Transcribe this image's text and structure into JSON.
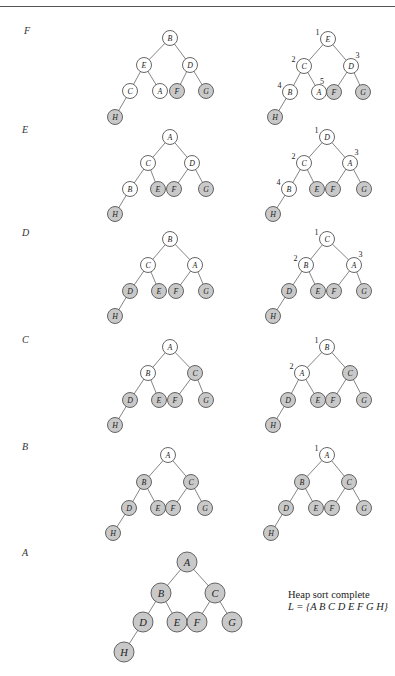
{
  "colors": {
    "sorted_fill": "#c9c9c9",
    "unsorted_fill": "#ffffff",
    "stroke": "#555555",
    "edge": "#666666",
    "text": "#222222",
    "rule": "#555555"
  },
  "edges": [
    [
      "0",
      "1"
    ],
    [
      "0",
      "2"
    ],
    [
      "1",
      "3"
    ],
    [
      "1",
      "4"
    ],
    [
      "2",
      "5"
    ],
    [
      "2",
      "6"
    ],
    [
      "3",
      "7"
    ]
  ],
  "steps": [
    {
      "label": "F",
      "label_pos": [
        24,
        32
      ],
      "before": {
        "r": 7.5,
        "nodes": [
          {
            "id": "0",
            "letter": "B",
            "x": 170,
            "y": 38,
            "sorted": false
          },
          {
            "id": "1",
            "letter": "E",
            "x": 144,
            "y": 65,
            "sorted": false
          },
          {
            "id": "2",
            "letter": "D",
            "x": 190,
            "y": 65,
            "sorted": false
          },
          {
            "id": "3",
            "letter": "C",
            "x": 130,
            "y": 91,
            "sorted": false
          },
          {
            "id": "4",
            "letter": "A",
            "x": 160,
            "y": 91,
            "sorted": false
          },
          {
            "id": "5",
            "letter": "F",
            "x": 177,
            "y": 91,
            "sorted": true
          },
          {
            "id": "6",
            "letter": "G",
            "x": 206,
            "y": 91,
            "sorted": true
          },
          {
            "id": "7",
            "letter": "H",
            "x": 115,
            "y": 117,
            "sorted": true
          }
        ]
      },
      "after": {
        "r": 7.5,
        "nodes": [
          {
            "id": "0",
            "letter": "E",
            "x": 328,
            "y": 39,
            "sorted": false,
            "index": "1"
          },
          {
            "id": "1",
            "letter": "C",
            "x": 304,
            "y": 66,
            "sorted": false,
            "index": "2"
          },
          {
            "id": "2",
            "letter": "D",
            "x": 351,
            "y": 66,
            "sorted": false,
            "index": "3"
          },
          {
            "id": "3",
            "letter": "B",
            "x": 290,
            "y": 92,
            "sorted": false,
            "index": "4"
          },
          {
            "id": "4",
            "letter": "A",
            "x": 319,
            "y": 92,
            "sorted": false,
            "index": "5"
          },
          {
            "id": "5",
            "letter": "F",
            "x": 334,
            "y": 92,
            "sorted": true
          },
          {
            "id": "6",
            "letter": "G",
            "x": 363,
            "y": 92,
            "sorted": true
          },
          {
            "id": "7",
            "letter": "H",
            "x": 275,
            "y": 117,
            "sorted": true
          }
        ]
      }
    },
    {
      "label": "E",
      "label_pos": [
        22,
        131
      ],
      "before": {
        "r": 7.5,
        "nodes": [
          {
            "id": "0",
            "letter": "A",
            "x": 170,
            "y": 137,
            "sorted": false
          },
          {
            "id": "1",
            "letter": "C",
            "x": 148,
            "y": 163,
            "sorted": false
          },
          {
            "id": "2",
            "letter": "D",
            "x": 192,
            "y": 163,
            "sorted": false
          },
          {
            "id": "3",
            "letter": "B",
            "x": 130,
            "y": 189,
            "sorted": false
          },
          {
            "id": "4",
            "letter": "E",
            "x": 158,
            "y": 189,
            "sorted": true
          },
          {
            "id": "5",
            "letter": "F",
            "x": 174,
            "y": 189,
            "sorted": true
          },
          {
            "id": "6",
            "letter": "G",
            "x": 206,
            "y": 189,
            "sorted": true
          },
          {
            "id": "7",
            "letter": "H",
            "x": 115,
            "y": 214,
            "sorted": true
          }
        ]
      },
      "after": {
        "r": 7.5,
        "nodes": [
          {
            "id": "0",
            "letter": "D",
            "x": 327,
            "y": 137,
            "sorted": false,
            "index": "1"
          },
          {
            "id": "1",
            "letter": "C",
            "x": 304,
            "y": 163,
            "sorted": false,
            "index": "2"
          },
          {
            "id": "2",
            "letter": "A",
            "x": 350,
            "y": 163,
            "sorted": false,
            "index": "3"
          },
          {
            "id": "3",
            "letter": "B",
            "x": 289,
            "y": 189,
            "sorted": false,
            "index": "4"
          },
          {
            "id": "4",
            "letter": "E",
            "x": 317,
            "y": 189,
            "sorted": true
          },
          {
            "id": "5",
            "letter": "F",
            "x": 333,
            "y": 189,
            "sorted": true
          },
          {
            "id": "6",
            "letter": "G",
            "x": 364,
            "y": 189,
            "sorted": true
          },
          {
            "id": "7",
            "letter": "H",
            "x": 273,
            "y": 214,
            "sorted": true
          }
        ]
      }
    },
    {
      "label": "D",
      "label_pos": [
        22,
        234
      ],
      "before": {
        "r": 7.5,
        "nodes": [
          {
            "id": "0",
            "letter": "B",
            "x": 170,
            "y": 239,
            "sorted": false
          },
          {
            "id": "1",
            "letter": "C",
            "x": 148,
            "y": 265,
            "sorted": false
          },
          {
            "id": "2",
            "letter": "A",
            "x": 195,
            "y": 265,
            "sorted": false
          },
          {
            "id": "3",
            "letter": "D",
            "x": 130,
            "y": 291,
            "sorted": true
          },
          {
            "id": "4",
            "letter": "E",
            "x": 159,
            "y": 291,
            "sorted": true
          },
          {
            "id": "5",
            "letter": "F",
            "x": 176,
            "y": 291,
            "sorted": true
          },
          {
            "id": "6",
            "letter": "G",
            "x": 206,
            "y": 291,
            "sorted": true
          },
          {
            "id": "7",
            "letter": "H",
            "x": 115,
            "y": 316,
            "sorted": true
          }
        ]
      },
      "after": {
        "r": 7.5,
        "nodes": [
          {
            "id": "0",
            "letter": "C",
            "x": 327,
            "y": 239,
            "sorted": false,
            "index": "1"
          },
          {
            "id": "1",
            "letter": "B",
            "x": 306,
            "y": 265,
            "sorted": false,
            "index": "2"
          },
          {
            "id": "2",
            "letter": "A",
            "x": 354,
            "y": 265,
            "sorted": false,
            "index": "3"
          },
          {
            "id": "3",
            "letter": "D",
            "x": 289,
            "y": 291,
            "sorted": true
          },
          {
            "id": "4",
            "letter": "E",
            "x": 318,
            "y": 291,
            "sorted": true
          },
          {
            "id": "5",
            "letter": "F",
            "x": 334,
            "y": 291,
            "sorted": true
          },
          {
            "id": "6",
            "letter": "G",
            "x": 364,
            "y": 291,
            "sorted": true
          },
          {
            "id": "7",
            "letter": "H",
            "x": 273,
            "y": 316,
            "sorted": true
          }
        ]
      }
    },
    {
      "label": "C",
      "label_pos": [
        22,
        341
      ],
      "before": {
        "r": 7.5,
        "nodes": [
          {
            "id": "0",
            "letter": "A",
            "x": 170,
            "y": 347,
            "sorted": false
          },
          {
            "id": "1",
            "letter": "B",
            "x": 148,
            "y": 373,
            "sorted": false
          },
          {
            "id": "2",
            "letter": "C",
            "x": 195,
            "y": 373,
            "sorted": true
          },
          {
            "id": "3",
            "letter": "D",
            "x": 130,
            "y": 400,
            "sorted": true
          },
          {
            "id": "4",
            "letter": "E",
            "x": 159,
            "y": 400,
            "sorted": true
          },
          {
            "id": "5",
            "letter": "F",
            "x": 175,
            "y": 400,
            "sorted": true
          },
          {
            "id": "6",
            "letter": "G",
            "x": 206,
            "y": 400,
            "sorted": true
          },
          {
            "id": "7",
            "letter": "H",
            "x": 115,
            "y": 425,
            "sorted": true
          }
        ]
      },
      "after": {
        "r": 7.5,
        "nodes": [
          {
            "id": "0",
            "letter": "B",
            "x": 327,
            "y": 347,
            "sorted": false,
            "index": "1"
          },
          {
            "id": "1",
            "letter": "A",
            "x": 302,
            "y": 373,
            "sorted": false,
            "index": "2"
          },
          {
            "id": "2",
            "letter": "C",
            "x": 350,
            "y": 373,
            "sorted": true
          },
          {
            "id": "3",
            "letter": "D",
            "x": 288,
            "y": 400,
            "sorted": true
          },
          {
            "id": "4",
            "letter": "E",
            "x": 318,
            "y": 400,
            "sorted": true
          },
          {
            "id": "5",
            "letter": "F",
            "x": 333,
            "y": 400,
            "sorted": true
          },
          {
            "id": "6",
            "letter": "G",
            "x": 364,
            "y": 400,
            "sorted": true
          },
          {
            "id": "7",
            "letter": "H",
            "x": 273,
            "y": 425,
            "sorted": true
          }
        ]
      }
    },
    {
      "label": "B",
      "label_pos": [
        22,
        448
      ],
      "before": {
        "r": 7.5,
        "nodes": [
          {
            "id": "0",
            "letter": "A",
            "x": 168,
            "y": 455,
            "sorted": false
          },
          {
            "id": "1",
            "letter": "B",
            "x": 144,
            "y": 482,
            "sorted": true
          },
          {
            "id": "2",
            "letter": "C",
            "x": 191,
            "y": 482,
            "sorted": true
          },
          {
            "id": "3",
            "letter": "D",
            "x": 129,
            "y": 508,
            "sorted": true
          },
          {
            "id": "4",
            "letter": "E",
            "x": 158,
            "y": 508,
            "sorted": true
          },
          {
            "id": "5",
            "letter": "F",
            "x": 173,
            "y": 508,
            "sorted": true
          },
          {
            "id": "6",
            "letter": "G",
            "x": 205,
            "y": 508,
            "sorted": true
          },
          {
            "id": "7",
            "letter": "H",
            "x": 113,
            "y": 533,
            "sorted": true
          }
        ]
      },
      "after": {
        "r": 7.5,
        "nodes": [
          {
            "id": "0",
            "letter": "A",
            "x": 327,
            "y": 455,
            "sorted": false,
            "index": "1"
          },
          {
            "id": "1",
            "letter": "B",
            "x": 302,
            "y": 482,
            "sorted": true
          },
          {
            "id": "2",
            "letter": "C",
            "x": 349,
            "y": 482,
            "sorted": true
          },
          {
            "id": "3",
            "letter": "D",
            "x": 286,
            "y": 508,
            "sorted": true
          },
          {
            "id": "4",
            "letter": "E",
            "x": 316,
            "y": 508,
            "sorted": true
          },
          {
            "id": "5",
            "letter": "F",
            "x": 332,
            "y": 508,
            "sorted": true
          },
          {
            "id": "6",
            "letter": "G",
            "x": 364,
            "y": 508,
            "sorted": true
          },
          {
            "id": "7",
            "letter": "H",
            "x": 271,
            "y": 533,
            "sorted": true
          }
        ]
      }
    },
    {
      "label": "A",
      "label_pos": [
        22,
        554
      ],
      "before": {
        "r": 10,
        "nodes": [
          {
            "id": "0",
            "letter": "A",
            "x": 187,
            "y": 562,
            "sorted": true
          },
          {
            "id": "1",
            "letter": "B",
            "x": 161,
            "y": 593,
            "sorted": true
          },
          {
            "id": "2",
            "letter": "C",
            "x": 215,
            "y": 593,
            "sorted": true
          },
          {
            "id": "3",
            "letter": "D",
            "x": 143,
            "y": 622,
            "sorted": true
          },
          {
            "id": "4",
            "letter": "E",
            "x": 177,
            "y": 622,
            "sorted": true
          },
          {
            "id": "5",
            "letter": "F",
            "x": 197,
            "y": 622,
            "sorted": true
          },
          {
            "id": "6",
            "letter": "G",
            "x": 232,
            "y": 622,
            "sorted": true
          },
          {
            "id": "7",
            "letter": "H",
            "x": 124,
            "y": 652,
            "sorted": true
          }
        ]
      },
      "after": null
    }
  ],
  "caption": {
    "title": "Heap sort complete",
    "result": "L = {A B C D E F G H}"
  }
}
